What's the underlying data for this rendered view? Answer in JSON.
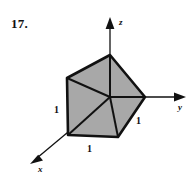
{
  "figure": {
    "problem_number": "17.",
    "background_color": "#ffffff",
    "ink_color": "#111111",
    "cube_fill_color": "#a8a8a8",
    "axes": [
      {
        "name": "z",
        "label": "z",
        "direction": "up"
      },
      {
        "name": "y",
        "label": "y",
        "direction": "right"
      },
      {
        "name": "x",
        "label": "x",
        "direction": "down-left"
      }
    ],
    "edge_labels": [
      {
        "name": "left-edge",
        "label": "1"
      },
      {
        "name": "bottom-edge",
        "label": "1"
      },
      {
        "name": "right-edge",
        "label": "1"
      }
    ],
    "shape": {
      "name": "unit-cube",
      "description": "shaded unit cube at origin"
    }
  }
}
